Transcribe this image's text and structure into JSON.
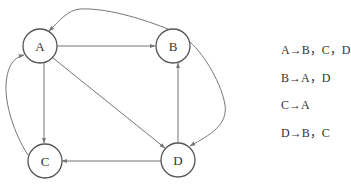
{
  "diagram": {
    "type": "directed-graph",
    "nodes": [
      {
        "id": "A",
        "label": "A",
        "cx": 40,
        "cy": 46
      },
      {
        "id": "B",
        "label": "B",
        "cx": 173,
        "cy": 46
      },
      {
        "id": "C",
        "label": "C",
        "cx": 45,
        "cy": 161
      },
      {
        "id": "D",
        "label": "D",
        "cx": 178,
        "cy": 160
      }
    ],
    "edges": [
      {
        "from": "A",
        "to": "B"
      },
      {
        "from": "A",
        "to": "C"
      },
      {
        "from": "A",
        "to": "D"
      },
      {
        "from": "B",
        "to": "A"
      },
      {
        "from": "B",
        "to": "D"
      },
      {
        "from": "C",
        "to": "A"
      },
      {
        "from": "D",
        "to": "B"
      },
      {
        "from": "D",
        "to": "C"
      }
    ],
    "colors": {
      "node_stroke": "#555555",
      "edge": "#777777",
      "text": "#333333"
    }
  },
  "adjacency_list": [
    {
      "text": "A→B，C，D"
    },
    {
      "text": "B→A，D"
    },
    {
      "text": "C→A"
    },
    {
      "text": "D→B，C"
    }
  ]
}
